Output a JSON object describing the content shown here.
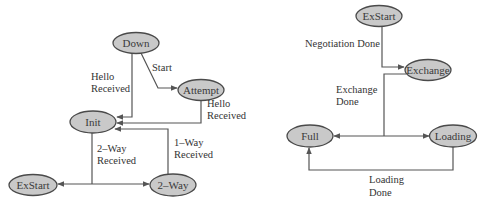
{
  "diagrams": [
    {
      "name": "neighbor-state-machine",
      "nodes": [
        {
          "id": "down",
          "label": "Down",
          "cx": 136,
          "cy": 43
        },
        {
          "id": "attempt",
          "label": "Attempt",
          "cx": 201,
          "cy": 90
        },
        {
          "id": "init",
          "label": "Init",
          "cx": 93,
          "cy": 122
        },
        {
          "id": "exstart",
          "label": "ExStart",
          "cx": 33,
          "cy": 185
        },
        {
          "id": "twoway",
          "label": "2–Way",
          "cx": 173,
          "cy": 185
        }
      ],
      "edges": [
        {
          "from": "down",
          "to": "attempt",
          "label": "Start"
        },
        {
          "from": "down",
          "to": "init",
          "label": "Hello Received"
        },
        {
          "from": "attempt",
          "to": "init",
          "label": "Hello Received"
        },
        {
          "from": "twoway",
          "to": "init",
          "label": "1–Way Received"
        },
        {
          "from": "init",
          "to": "exstart",
          "label": "2–Way Received"
        },
        {
          "from": "init",
          "to": "twoway",
          "label": "2–Way Received"
        }
      ],
      "labels": {
        "start": "Start",
        "hello_received_1_line1": "Hello",
        "hello_received_1_line2": "Received",
        "hello_received_2_line1": "Hello",
        "hello_received_2_line2": "Received",
        "two_way_received_line1": "2–Way",
        "two_way_received_line2": "Received",
        "one_way_received_line1": "1–Way",
        "one_way_received_line2": "Received"
      }
    },
    {
      "name": "adjacency-state-machine",
      "nodes": [
        {
          "id": "exstart",
          "label": "ExStart",
          "cx": 379,
          "cy": 16
        },
        {
          "id": "exchange",
          "label": "Exchange",
          "cx": 428,
          "cy": 70
        },
        {
          "id": "full",
          "label": "Full",
          "cx": 310,
          "cy": 136
        },
        {
          "id": "loading",
          "label": "Loading",
          "cx": 453,
          "cy": 136
        }
      ],
      "edges": [
        {
          "from": "exstart",
          "to": "exchange",
          "label": "Negotiation Done"
        },
        {
          "from": "exchange",
          "to": "full",
          "label": "Exchange Done"
        },
        {
          "from": "exchange",
          "to": "loading",
          "label": "Exchange Done"
        },
        {
          "from": "loading",
          "to": "full",
          "label": "Loading Done"
        }
      ],
      "labels": {
        "negotiation_done": "Negotiation Done",
        "exchange_done_line1": "Exchange",
        "exchange_done_line2": "Done",
        "loading_done_line1": "Loading",
        "loading_done_line2": "Done"
      }
    }
  ],
  "colors": {
    "node_fill": "#c9c9c9",
    "node_stroke": "#4a4a4a",
    "edge": "#555555",
    "text": "#333333"
  }
}
